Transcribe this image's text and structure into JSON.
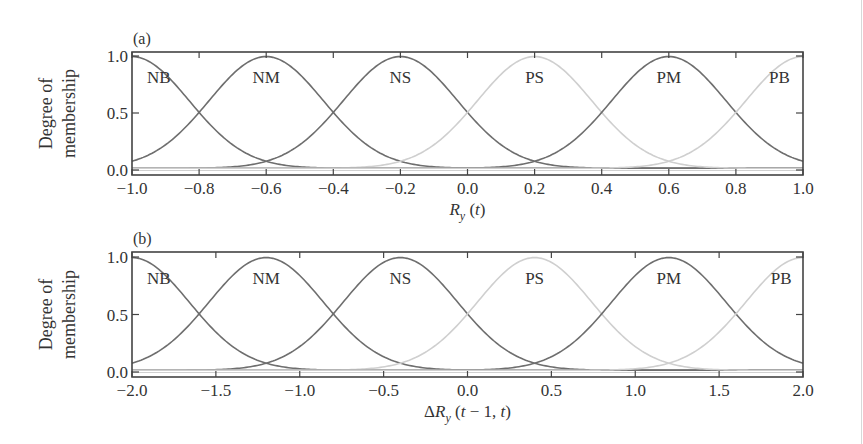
{
  "chart_data": [
    {
      "type": "line",
      "panel": "(a)",
      "title": "",
      "xlabel": "R_y (t)",
      "xlabel_parts": {
        "main": "R",
        "sub": "y",
        "rest": " (t)"
      },
      "ylabel": [
        "Degree of",
        "membership"
      ],
      "xlim": [
        -1.0,
        1.0
      ],
      "ylim": [
        0.0,
        1.0
      ],
      "xticks": [
        "-1.0",
        "-0.8",
        "-0.6",
        "-0.4",
        "-0.2",
        "0.0",
        "0.2",
        "0.4",
        "0.6",
        "0.8",
        "1.0"
      ],
      "xtick_values": [
        -1.0,
        -0.8,
        -0.6,
        -0.4,
        -0.2,
        0.0,
        0.2,
        0.4,
        0.6,
        0.8,
        1.0
      ],
      "yticks": [
        "0.0",
        "0.5",
        "1.0"
      ],
      "ytick_values": [
        0.0,
        0.5,
        1.0
      ],
      "grid": false,
      "legend": "inline labels",
      "function": "gaussian",
      "sigma": 0.17,
      "series": [
        {
          "name": "NB",
          "center": -1.0,
          "peak": 0.98,
          "color": "#6e6e6e",
          "label_x": -0.92,
          "label_y": 0.82
        },
        {
          "name": "NM",
          "center": -0.6,
          "peak": 0.98,
          "color": "#6e6e6e",
          "label_x": -0.6,
          "label_y": 0.82
        },
        {
          "name": "NS",
          "center": -0.2,
          "peak": 0.98,
          "color": "#6e6e6e",
          "label_x": -0.2,
          "label_y": 0.82
        },
        {
          "name": "PS",
          "center": 0.2,
          "peak": 0.98,
          "color": "#cfcfcf",
          "label_x": 0.2,
          "label_y": 0.82
        },
        {
          "name": "PM",
          "center": 0.6,
          "peak": 0.98,
          "color": "#6e6e6e",
          "label_x": 0.6,
          "label_y": 0.82
        },
        {
          "name": "PB",
          "center": 1.0,
          "peak": 0.98,
          "color": "#cfcfcf",
          "label_x": 0.93,
          "label_y": 0.82
        }
      ]
    },
    {
      "type": "line",
      "panel": "(b)",
      "title": "",
      "xlabel": "ΔR_y (t − 1, t)",
      "xlabel_parts": {
        "main": "ΔR",
        "sub": "y",
        "rest": " (t − 1, t)"
      },
      "ylabel": [
        "Degree of",
        "membership"
      ],
      "xlim": [
        -2.0,
        2.0
      ],
      "ylim": [
        0.0,
        1.0
      ],
      "xticks": [
        "-2.0",
        "-1.5",
        "-1.0",
        "-0.5",
        "0.0",
        "0.5",
        "1.0",
        "1.5",
        "2.0"
      ],
      "xtick_values": [
        -2.0,
        -1.5,
        -1.0,
        -0.5,
        0.0,
        0.5,
        1.0,
        1.5,
        2.0
      ],
      "yticks": [
        "0.0",
        "0.5",
        "1.0"
      ],
      "ytick_values": [
        0.0,
        0.5,
        1.0
      ],
      "grid": false,
      "legend": "inline labels",
      "function": "gaussian",
      "sigma": 0.34,
      "series": [
        {
          "name": "NB",
          "center": -2.0,
          "peak": 0.98,
          "color": "#6e6e6e",
          "label_x": -1.84,
          "label_y": 0.82
        },
        {
          "name": "NM",
          "center": -1.2,
          "peak": 0.98,
          "color": "#6e6e6e",
          "label_x": -1.2,
          "label_y": 0.82
        },
        {
          "name": "NS",
          "center": -0.4,
          "peak": 0.98,
          "color": "#6e6e6e",
          "label_x": -0.4,
          "label_y": 0.82
        },
        {
          "name": "PS",
          "center": 0.4,
          "peak": 0.98,
          "color": "#cfcfcf",
          "label_x": 0.4,
          "label_y": 0.82
        },
        {
          "name": "PM",
          "center": 1.2,
          "peak": 0.98,
          "color": "#6e6e6e",
          "label_x": 1.2,
          "label_y": 0.82
        },
        {
          "name": "PB",
          "center": 2.0,
          "peak": 0.98,
          "color": "#cfcfcf",
          "label_x": 1.87,
          "label_y": 0.82
        }
      ]
    }
  ],
  "layout": {
    "panels": [
      {
        "left": 132,
        "right": 803,
        "top": 52,
        "bottom": 175,
        "y0": 170,
        "y1": 56,
        "tag_x": 133,
        "tag_y": 44,
        "xtick_y": 194,
        "xlabel_y": 215
      },
      {
        "left": 132,
        "right": 803,
        "top": 252,
        "bottom": 377,
        "y0": 372,
        "y1": 257,
        "tag_x": 133,
        "tag_y": 244,
        "xtick_y": 396,
        "xlabel_y": 417
      }
    ],
    "frame_color": "#444444",
    "baseline_color": "#d0d0d0"
  }
}
